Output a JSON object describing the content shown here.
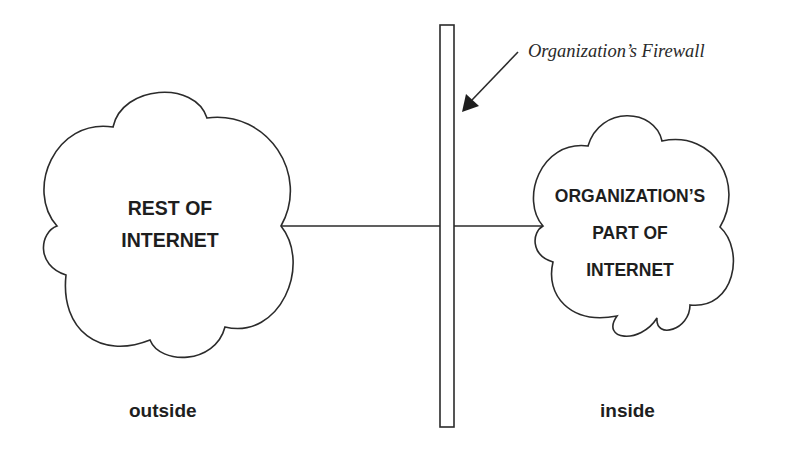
{
  "diagram": {
    "firewall": {
      "label": "Organization’s Firewall"
    },
    "outside_cloud": {
      "line1": "REST OF",
      "line2": "INTERNET"
    },
    "inside_cloud": {
      "line1": "ORGANIZATION’S",
      "line2": "PART OF",
      "line3": "INTERNET"
    },
    "zones": {
      "outside": "outside",
      "inside": "inside"
    },
    "colors": {
      "stroke": "#2b2b2b",
      "text": "#1e1e1e",
      "background": "#ffffff"
    }
  }
}
